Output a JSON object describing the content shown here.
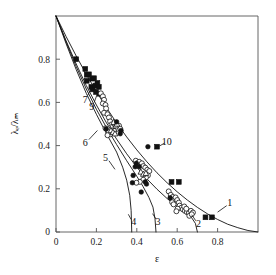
{
  "chart_data": {
    "type": "scatter",
    "title": "",
    "xlabel": "ε",
    "ylabel": "λₑ/λₘ",
    "xlim": [
      0,
      1.0
    ],
    "ylim": [
      0,
      1.0
    ],
    "grid": false,
    "legend": "inline-curve-numbers",
    "xticks": [
      "0",
      "0.2",
      "0.4",
      "0.6",
      "0.8"
    ],
    "xtick_values": [
      0,
      0.2,
      0.4,
      0.6,
      0.8
    ],
    "yticks": [
      "0",
      "0.2",
      "0.4",
      "0.6",
      "0.8"
    ],
    "ytick_values": [
      0,
      0.2,
      0.4,
      0.6,
      0.8
    ],
    "curves": [
      {
        "name": "1",
        "label": "1",
        "label_x": 0.86,
        "label_y": 0.135,
        "leader": [
          [
            0.845,
            0.122
          ],
          [
            0.8,
            0.092
          ]
        ],
        "points": [
          [
            0.0,
            1.0
          ],
          [
            0.05,
            0.905
          ],
          [
            0.1,
            0.815
          ],
          [
            0.15,
            0.73
          ],
          [
            0.2,
            0.65
          ],
          [
            0.25,
            0.575
          ],
          [
            0.3,
            0.505
          ],
          [
            0.35,
            0.44
          ],
          [
            0.4,
            0.38
          ],
          [
            0.45,
            0.325
          ],
          [
            0.5,
            0.274
          ],
          [
            0.55,
            0.228
          ],
          [
            0.6,
            0.186
          ],
          [
            0.65,
            0.148
          ],
          [
            0.7,
            0.114
          ],
          [
            0.75,
            0.084
          ],
          [
            0.8,
            0.058
          ],
          [
            0.85,
            0.036
          ],
          [
            0.9,
            0.02
          ],
          [
            0.95,
            0.007
          ],
          [
            1.0,
            0.0
          ]
        ]
      },
      {
        "name": "2",
        "label": "2",
        "label_x": 0.705,
        "label_y": 0.038,
        "leader": [
          [
            0.692,
            0.052
          ],
          [
            0.672,
            0.08
          ]
        ],
        "points": [
          [
            0.0,
            1.0
          ],
          [
            0.05,
            0.885
          ],
          [
            0.1,
            0.778
          ],
          [
            0.15,
            0.678
          ],
          [
            0.2,
            0.588
          ],
          [
            0.25,
            0.505
          ],
          [
            0.3,
            0.43
          ],
          [
            0.35,
            0.362
          ],
          [
            0.4,
            0.3
          ],
          [
            0.45,
            0.246
          ],
          [
            0.5,
            0.198
          ],
          [
            0.55,
            0.155
          ],
          [
            0.6,
            0.118
          ],
          [
            0.64,
            0.09
          ],
          [
            0.67,
            0.068
          ],
          [
            0.69,
            0.04
          ],
          [
            0.7,
            0.0
          ]
        ]
      },
      {
        "name": "3",
        "label": "3",
        "label_x": 0.505,
        "label_y": 0.048,
        "leader": [
          [
            0.495,
            0.06
          ],
          [
            0.478,
            0.085
          ]
        ],
        "points": [
          [
            0.0,
            1.0
          ],
          [
            0.05,
            0.88
          ],
          [
            0.1,
            0.766
          ],
          [
            0.15,
            0.662
          ],
          [
            0.2,
            0.568
          ],
          [
            0.25,
            0.483
          ],
          [
            0.3,
            0.405
          ],
          [
            0.35,
            0.33
          ],
          [
            0.4,
            0.258
          ],
          [
            0.43,
            0.212
          ],
          [
            0.46,
            0.16
          ],
          [
            0.48,
            0.115
          ],
          [
            0.49,
            0.062
          ],
          [
            0.495,
            0.0
          ]
        ]
      },
      {
        "name": "4",
        "label": "4",
        "label_x": 0.385,
        "label_y": 0.048,
        "leader": [
          [
            0.372,
            0.058
          ],
          [
            0.358,
            0.082
          ]
        ],
        "points": [
          [
            0.0,
            1.0
          ],
          [
            0.05,
            0.872
          ],
          [
            0.1,
            0.752
          ],
          [
            0.15,
            0.642
          ],
          [
            0.2,
            0.545
          ],
          [
            0.25,
            0.455
          ],
          [
            0.3,
            0.37
          ],
          [
            0.33,
            0.3
          ],
          [
            0.35,
            0.24
          ],
          [
            0.365,
            0.17
          ],
          [
            0.372,
            0.1
          ],
          [
            0.375,
            0.0
          ]
        ]
      },
      {
        "name": "5",
        "label": "5",
        "label_x": 0.245,
        "label_y": 0.345,
        "leader": [
          [
            0.262,
            0.33
          ],
          [
            0.292,
            0.29
          ]
        ]
      },
      {
        "name": "6",
        "label": "6",
        "label_x": 0.145,
        "label_y": 0.412,
        "leader": [
          [
            0.163,
            0.428
          ],
          [
            0.205,
            0.47
          ]
        ]
      },
      {
        "name": "7",
        "label": "7",
        "label_x": 0.145,
        "label_y": 0.612,
        "leader": [
          [
            0.157,
            0.632
          ],
          [
            0.178,
            0.672
          ]
        ]
      },
      {
        "name": "9",
        "label": "9",
        "label_x": 0.177,
        "label_y": 0.58,
        "leader": [
          [
            0.189,
            0.6
          ],
          [
            0.208,
            0.648
          ]
        ]
      },
      {
        "name": "10",
        "label": "10",
        "label_x": 0.548,
        "label_y": 0.418,
        "leader": [
          [
            0.538,
            0.412
          ],
          [
            0.512,
            0.398
          ]
        ]
      }
    ],
    "series": [
      {
        "name": "filled-squares-upper",
        "marker": "filled-square",
        "points": [
          [
            0.1,
            0.8
          ],
          [
            0.145,
            0.755
          ],
          [
            0.152,
            0.728
          ],
          [
            0.163,
            0.73
          ],
          [
            0.152,
            0.7
          ],
          [
            0.178,
            0.71
          ],
          [
            0.188,
            0.712
          ],
          [
            0.175,
            0.672
          ],
          [
            0.182,
            0.66
          ],
          [
            0.195,
            0.678
          ],
          [
            0.205,
            0.69
          ],
          [
            0.212,
            0.672
          ],
          [
            0.198,
            0.648
          ],
          [
            0.215,
            0.64
          ]
        ]
      },
      {
        "name": "filled-squares-10",
        "marker": "filled-square",
        "points": [
          [
            0.5,
            0.395
          ]
        ]
      },
      {
        "name": "filled-squares-mid",
        "marker": "filled-square",
        "points": [
          [
            0.572,
            0.232
          ],
          [
            0.608,
            0.232
          ]
        ]
      },
      {
        "name": "filled-squares-2",
        "marker": "filled-square",
        "points": [
          [
            0.74,
            0.068
          ],
          [
            0.772,
            0.068
          ]
        ]
      },
      {
        "name": "open-circles",
        "marker": "open-circle",
        "points": [
          [
            0.222,
            0.642
          ],
          [
            0.232,
            0.628
          ],
          [
            0.238,
            0.612
          ],
          [
            0.232,
            0.595
          ],
          [
            0.245,
            0.588
          ],
          [
            0.248,
            0.572
          ],
          [
            0.238,
            0.552
          ],
          [
            0.255,
            0.545
          ],
          [
            0.262,
            0.53
          ],
          [
            0.268,
            0.512
          ],
          [
            0.275,
            0.498
          ],
          [
            0.282,
            0.488
          ],
          [
            0.29,
            0.498
          ],
          [
            0.298,
            0.488
          ],
          [
            0.305,
            0.478
          ],
          [
            0.288,
            0.468
          ],
          [
            0.278,
            0.458
          ],
          [
            0.268,
            0.452
          ],
          [
            0.262,
            0.462
          ],
          [
            0.255,
            0.448
          ],
          [
            0.245,
            0.48
          ],
          [
            0.312,
            0.492
          ],
          [
            0.318,
            0.478
          ],
          [
            0.395,
            0.33
          ],
          [
            0.405,
            0.318
          ],
          [
            0.412,
            0.325
          ],
          [
            0.425,
            0.318
          ],
          [
            0.432,
            0.305
          ],
          [
            0.442,
            0.298
          ],
          [
            0.452,
            0.288
          ],
          [
            0.462,
            0.282
          ],
          [
            0.455,
            0.262
          ],
          [
            0.445,
            0.252
          ],
          [
            0.432,
            0.242
          ],
          [
            0.415,
            0.232
          ],
          [
            0.398,
            0.228
          ],
          [
            0.558,
            0.188
          ],
          [
            0.568,
            0.172
          ],
          [
            0.578,
            0.162
          ],
          [
            0.585,
            0.15
          ],
          [
            0.575,
            0.138
          ],
          [
            0.582,
            0.128
          ],
          [
            0.592,
            0.16
          ],
          [
            0.6,
            0.148
          ],
          [
            0.608,
            0.136
          ],
          [
            0.612,
            0.122
          ],
          [
            0.62,
            0.112
          ],
          [
            0.628,
            0.105
          ],
          [
            0.638,
            0.098
          ],
          [
            0.648,
            0.092
          ],
          [
            0.658,
            0.088
          ],
          [
            0.668,
            0.098
          ],
          [
            0.678,
            0.09
          ],
          [
            0.635,
            0.118
          ],
          [
            0.645,
            0.108
          ],
          [
            0.602,
            0.108
          ],
          [
            0.596,
            0.096
          ],
          [
            0.66,
            0.075
          ],
          [
            0.672,
            0.082
          ]
        ]
      },
      {
        "name": "open-triangles",
        "marker": "open-triangle",
        "points": [
          [
            0.285,
            0.508
          ],
          [
            0.295,
            0.492
          ],
          [
            0.302,
            0.5
          ],
          [
            0.272,
            0.47
          ],
          [
            0.282,
            0.462
          ],
          [
            0.292,
            0.455
          ],
          [
            0.42,
            0.278
          ],
          [
            0.432,
            0.268
          ],
          [
            0.445,
            0.272
          ]
        ]
      },
      {
        "name": "filled-circles",
        "marker": "filled-circle",
        "points": [
          [
            0.248,
            0.478
          ],
          [
            0.322,
            0.47
          ],
          [
            0.318,
            0.455
          ],
          [
            0.398,
            0.318
          ],
          [
            0.392,
            0.302
          ],
          [
            0.412,
            0.302
          ],
          [
            0.442,
            0.232
          ],
          [
            0.448,
            0.222
          ],
          [
            0.455,
            0.395
          ],
          [
            0.3,
            0.51
          ],
          [
            0.382,
            0.262
          ],
          [
            0.378,
            0.228
          ],
          [
            0.422,
            0.185
          ],
          [
            0.565,
            0.158
          ]
        ]
      }
    ]
  },
  "figure": {
    "frame_color": "#555555",
    "curve_color": "#111111",
    "background": "#ffffff"
  }
}
